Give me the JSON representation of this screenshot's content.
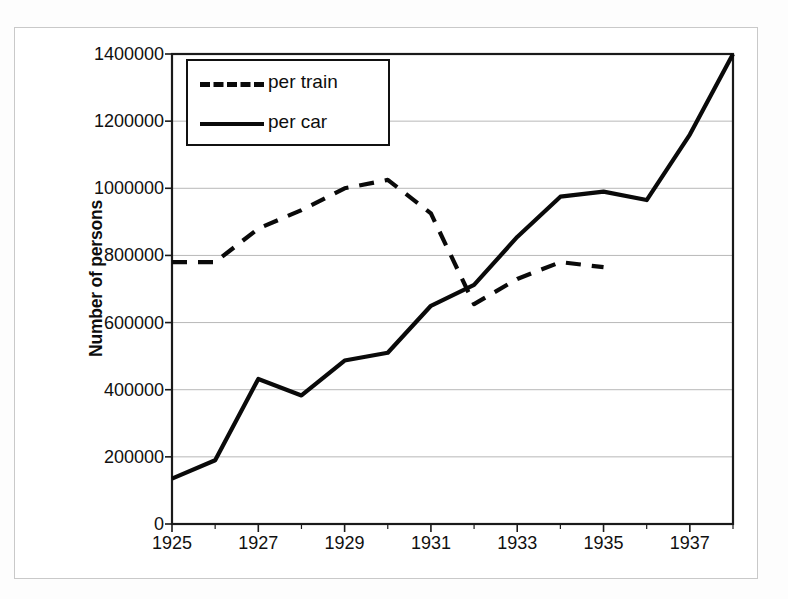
{
  "chart_data": {
    "type": "line",
    "title": "",
    "xlabel": "",
    "ylabel": "Number of persons",
    "xlim": [
      1925,
      1938
    ],
    "ylim": [
      0,
      1400000
    ],
    "x": [
      1925,
      1926,
      1927,
      1928,
      1929,
      1930,
      1931,
      1932,
      1933,
      1934,
      1935,
      1936,
      1937,
      1938
    ],
    "x_tick_labels": [
      "1925",
      "1927",
      "1929",
      "1931",
      "1933",
      "1935",
      "1937"
    ],
    "x_tick_values": [
      1925,
      1927,
      1929,
      1931,
      1933,
      1935,
      1937
    ],
    "y_tick_labels": [
      "0",
      "200000",
      "400000",
      "600000",
      "800000",
      "1000000",
      "1200000",
      "1400000"
    ],
    "y_tick_values": [
      0,
      200000,
      400000,
      600000,
      800000,
      1000000,
      1200000,
      1400000
    ],
    "grid": true,
    "legend_position": "top-left",
    "series": [
      {
        "name": "per train",
        "style": "dashed",
        "color": "#0a0a0a",
        "x": [
          1925,
          1926,
          1927,
          1928,
          1929,
          1930,
          1931,
          1932,
          1933,
          1934,
          1935
        ],
        "values": [
          780000,
          780000,
          880000,
          935000,
          1000000,
          1025000,
          925000,
          655000,
          730000,
          780000,
          765000
        ]
      },
      {
        "name": "per car",
        "style": "solid",
        "color": "#0a0a0a",
        "x": [
          1925,
          1926,
          1927,
          1928,
          1929,
          1930,
          1931,
          1932,
          1933,
          1934,
          1935,
          1936,
          1937,
          1938
        ],
        "values": [
          135000,
          190000,
          432000,
          383000,
          487000,
          510000,
          650000,
          712000,
          855000,
          975000,
          990000,
          965000,
          1160000,
          1400000
        ]
      }
    ]
  },
  "legend": {
    "items": [
      {
        "label": "per train",
        "style": "dashed"
      },
      {
        "label": "per car",
        "style": "solid"
      }
    ]
  },
  "axes": {
    "y_title": "Number of persons"
  },
  "colors": {
    "line": "#0a0a0a",
    "grid": "#b8b8b8",
    "axis": "#1a1a1a",
    "frame": "#c9c9c9",
    "background": "#ffffff"
  }
}
